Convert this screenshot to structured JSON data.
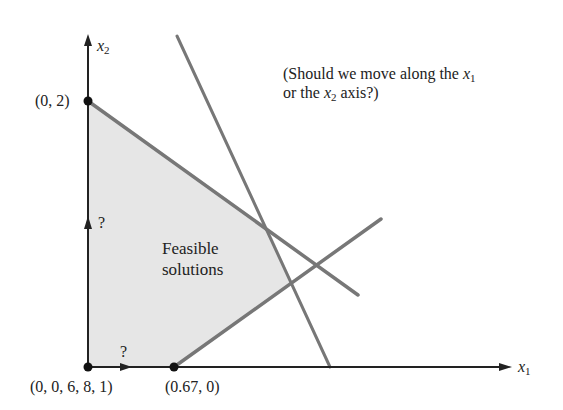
{
  "diagram": {
    "axes": {
      "x_label": "x",
      "x_sub": "1",
      "y_label": "x",
      "y_sub": "2"
    },
    "points": [
      {
        "label": "(0, 2)",
        "x": 0,
        "y": 2
      },
      {
        "label": "(0, 0, 6, 8, 1)",
        "x": 0,
        "y": 0
      },
      {
        "label": "(0.67, 0)",
        "x": 0.67,
        "y": 0
      }
    ],
    "region_label_line1": "Feasible",
    "region_label_line2": "solutions",
    "question_mark_x": "?",
    "question_mark_y": "?",
    "annotation": {
      "line1_prefix": "(Should we move along the ",
      "line1_var": "x",
      "line1_sub": "1",
      "line2_prefix": "or the ",
      "line2_var": "x",
      "line2_sub": "2",
      "line2_suffix": " axis?)"
    },
    "colors": {
      "axis": "#222222",
      "constraint": "#777777",
      "region": "#e6e6e6"
    }
  }
}
